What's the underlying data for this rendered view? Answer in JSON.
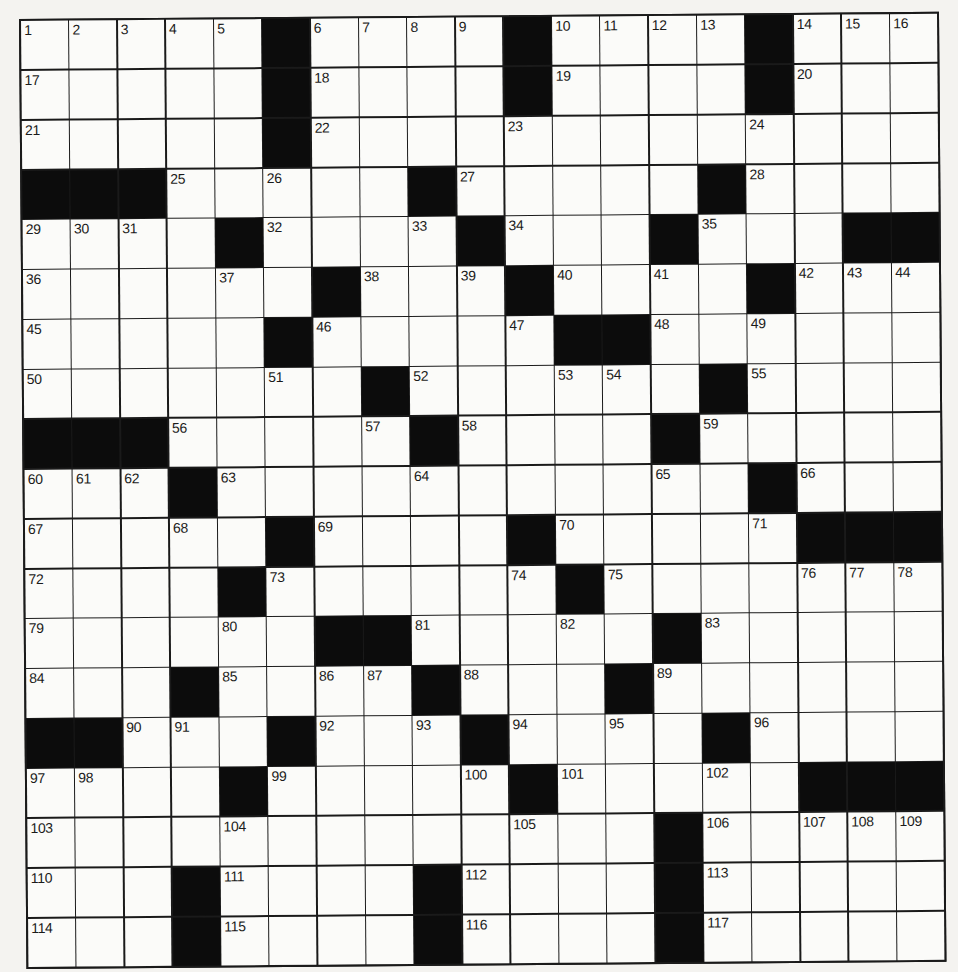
{
  "puzzle": {
    "size": {
      "rows": 19,
      "cols": 19
    },
    "colors": {
      "block": "#0c0c0c",
      "cell": "#fbfbf9",
      "line": "#1a1a1a",
      "paper": "#f4f3f0"
    },
    "layout": [
      ".....#....#....#...",
      ".....#....#....#...",
      ".....#.............",
      "###.....#.....#....",
      "....#....#...#...##",
      "......#...#....#...",
      ".....#.....##......",
      ".......#......#....",
      "###.....#....#.....",
      "...#...........#...",
      ".....#....#.....###",
      "....#......#.......",
      "......##.....#.....",
      "...#....#...#......",
      "##...#...#....#....",
      "....#.....#.....###",
      ".............#.....",
      "...#....#....#.....",
      "...#....#....#....."
    ],
    "numbers": [
      [
        "1",
        "2",
        "3",
        "4",
        "5",
        "",
        "6",
        "7",
        "8",
        "9",
        "",
        "10",
        "11",
        "12",
        "13",
        "",
        "14",
        "15",
        "16"
      ],
      [
        "17",
        "",
        "",
        "",
        "",
        "",
        "18",
        "",
        "",
        "",
        "",
        "19",
        "",
        "",
        "",
        "",
        "20",
        "",
        ""
      ],
      [
        "21",
        "",
        "",
        "",
        "",
        "",
        "22",
        "",
        "",
        "",
        "23",
        "",
        "",
        "",
        "",
        "24",
        "",
        "",
        ""
      ],
      [
        "",
        "",
        "",
        "25",
        "",
        "26",
        "",
        "",
        "",
        "27",
        "",
        "",
        "",
        "",
        "",
        "28",
        "",
        "",
        ""
      ],
      [
        "29",
        "30",
        "31",
        "",
        "",
        "32",
        "",
        "",
        "33",
        "",
        "34",
        "",
        "",
        "",
        "35",
        "",
        "",
        "",
        ""
      ],
      [
        "36",
        "",
        "",
        "",
        "37",
        "",
        "",
        "38",
        "",
        "39",
        "",
        "40",
        "",
        "41",
        "",
        "",
        "42",
        "43",
        "44"
      ],
      [
        "45",
        "",
        "",
        "",
        "",
        "",
        "46",
        "",
        "",
        "",
        "47",
        "",
        "",
        "48",
        "",
        "49",
        "",
        "",
        ""
      ],
      [
        "50",
        "",
        "",
        "",
        "",
        "51",
        "",
        "",
        "52",
        "",
        "",
        "53",
        "54",
        "",
        "",
        "55",
        "",
        "",
        ""
      ],
      [
        "",
        "",
        "",
        "56",
        "",
        "",
        "",
        "57",
        "",
        "58",
        "",
        "",
        "",
        "",
        "59",
        "",
        "",
        "",
        ""
      ],
      [
        "60",
        "61",
        "62",
        "",
        "63",
        "",
        "",
        "",
        "64",
        "",
        "",
        "",
        "",
        "65",
        "",
        "",
        "66",
        "",
        ""
      ],
      [
        "67",
        "",
        "",
        "68",
        "",
        "",
        "69",
        "",
        "",
        "",
        "",
        "70",
        "",
        "",
        "",
        "71",
        "",
        "",
        ""
      ],
      [
        "72",
        "",
        "",
        "",
        "",
        "73",
        "",
        "",
        "",
        "",
        "74",
        "",
        "75",
        "",
        "",
        "",
        "76",
        "77",
        "78"
      ],
      [
        "79",
        "",
        "",
        "",
        "80",
        "",
        "",
        "",
        "81",
        "",
        "",
        "82",
        "",
        "",
        "83",
        "",
        "",
        "",
        ""
      ],
      [
        "84",
        "",
        "",
        "",
        "85",
        "",
        "86",
        "87",
        "",
        "88",
        "",
        "",
        "",
        "89",
        "",
        "",
        "",
        "",
        ""
      ],
      [
        "",
        "",
        "90",
        "91",
        "",
        "",
        "92",
        "",
        "93",
        "",
        "94",
        "",
        "95",
        "",
        "",
        "96",
        "",
        "",
        ""
      ],
      [
        "97",
        "98",
        "",
        "",
        "",
        "99",
        "",
        "",
        "",
        "100",
        "",
        "101",
        "",
        "",
        "102",
        "",
        "",
        "",
        ""
      ],
      [
        "103",
        "",
        "",
        "",
        "104",
        "",
        "",
        "",
        "",
        "",
        "105",
        "",
        "",
        "",
        "106",
        "",
        "107",
        "108",
        "109"
      ],
      [
        "110",
        "",
        "",
        "",
        "111",
        "",
        "",
        "",
        "",
        "112",
        "",
        "",
        "",
        "",
        "113",
        "",
        "",
        "",
        ""
      ],
      [
        "114",
        "",
        "",
        "",
        "115",
        "",
        "",
        "",
        "",
        "116",
        "",
        "",
        "",
        "",
        "117",
        "",
        "",
        "",
        ""
      ]
    ]
  }
}
